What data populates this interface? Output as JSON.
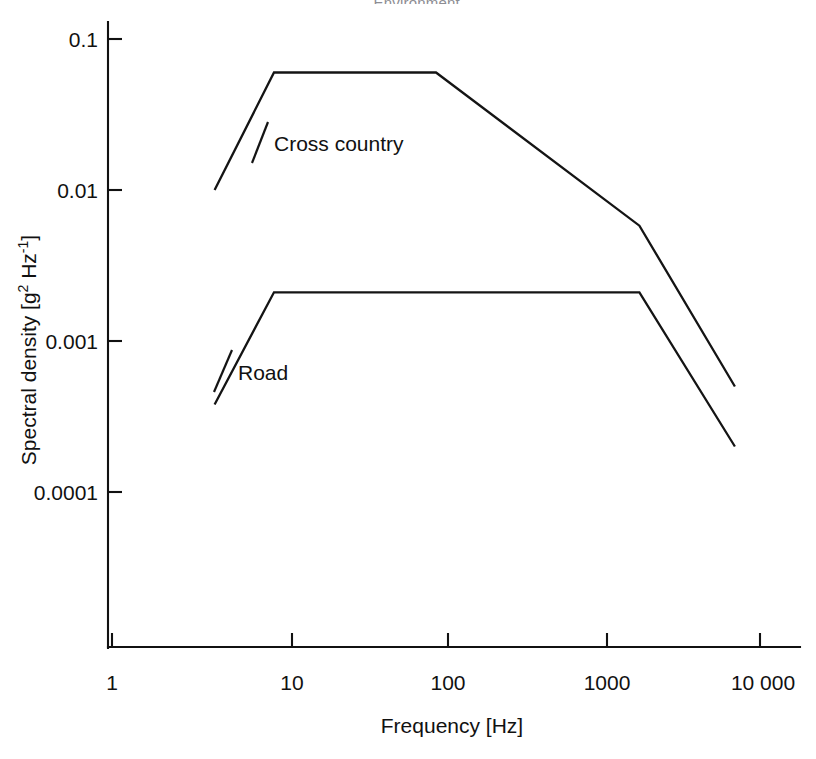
{
  "figure": {
    "title_partial": "... Environment",
    "background_color": "#ffffff",
    "line_color": "#141414"
  },
  "chart_data": {
    "type": "line",
    "title": "",
    "xlabel": "Frequency [Hz]",
    "ylabel_text": "Spectral density [g",
    "ylabel_sup1": "2",
    "ylabel_mid": " Hz",
    "ylabel_sup2": "-1",
    "ylabel_end": "]",
    "ylabel_full": "Spectral density [g2 Hz-1]",
    "xscale": "log",
    "yscale": "log",
    "xlim": [
      1,
      10000
    ],
    "ylim": [
      3e-05,
      0.15
    ],
    "xticks": [
      1,
      10,
      100,
      1000,
      10000
    ],
    "xticklabels": [
      "1",
      "10",
      "100",
      "1000",
      "10 000"
    ],
    "yticks": [
      0.1,
      0.01,
      0.001,
      0.0001
    ],
    "yticklabels": [
      "0.1",
      "0.01",
      "0.001",
      "0.0001"
    ],
    "grid": false,
    "legend": "inline-annotations",
    "series": [
      {
        "name": "Cross country",
        "label": "Cross country",
        "label_x": 11,
        "label_y": 0.026,
        "x": [
          4.3,
          10,
          100,
          1800,
          7000
        ],
        "y": [
          0.01,
          0.06,
          0.06,
          0.0058,
          0.0005
        ]
      },
      {
        "name": "Road",
        "label": "Road",
        "label_x": 11,
        "label_y": 0.00095,
        "x": [
          4.3,
          10,
          1800,
          7000
        ],
        "y": [
          0.00038,
          0.0021,
          0.0021,
          0.0002
        ]
      }
    ]
  },
  "axis_labels": {
    "y_0": "0.1",
    "y_1": "0.01",
    "y_2": "0.001",
    "y_3": "0.0001",
    "x_0": "1",
    "x_1": "10",
    "x_2": "100",
    "x_3": "1000",
    "x_4": "10 000"
  },
  "annotations": {
    "cross_country": "Cross country",
    "road": "Road"
  }
}
